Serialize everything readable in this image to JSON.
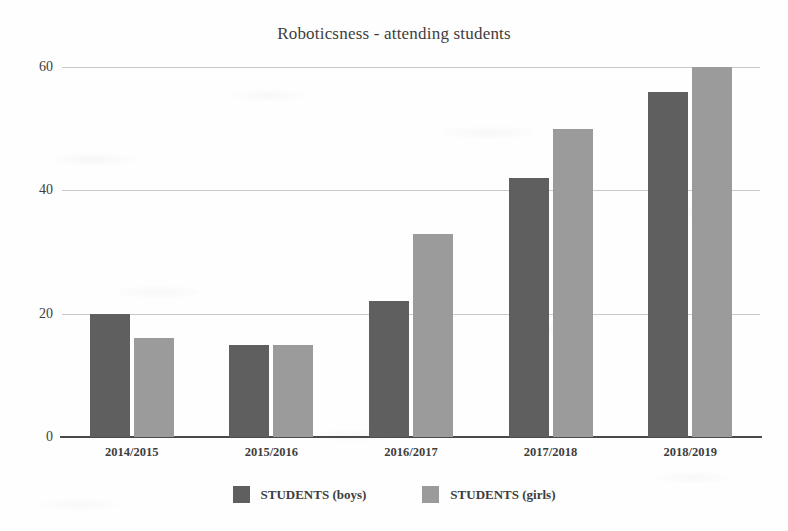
{
  "chart_data": {
    "type": "bar",
    "title": "Roboticsness - attending students",
    "xlabel": "",
    "ylabel": "",
    "categories": [
      "2014/2015",
      "2015/2016",
      "2016/2017",
      "2017/2018",
      "2018/2019"
    ],
    "series": [
      {
        "name": "STUDENTS (boys)",
        "color": "#5f5f5f",
        "values": [
          20,
          15,
          22,
          42,
          56
        ]
      },
      {
        "name": "STUDENTS (girls)",
        "color": "#9b9b9b",
        "values": [
          16,
          15,
          33,
          50,
          60
        ]
      }
    ],
    "ylim": [
      0,
      60
    ],
    "yticks": [
      0,
      20,
      40,
      60
    ],
    "ytick_labels": [
      "0",
      "20",
      "40",
      "60"
    ],
    "grid": true,
    "legend_position": "bottom"
  },
  "legend": {
    "items": [
      {
        "label": "STUDENTS (boys)",
        "color": "#5f5f5f"
      },
      {
        "label": "STUDENTS (girls)",
        "color": "#9b9b9b"
      }
    ]
  }
}
